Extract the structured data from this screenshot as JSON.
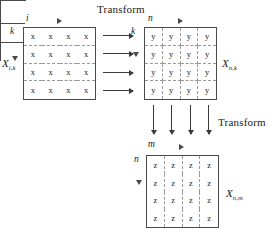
{
  "figure": {
    "type": "three-stage-transform-diagram",
    "transform_labels": [
      {
        "id": "transform-top",
        "text": "Transform"
      },
      {
        "id": "transform-right",
        "text": "Transform"
      }
    ],
    "matrices": [
      {
        "id": "matrix-x-ik",
        "name": "X",
        "subscript": "i,k",
        "entry": "x",
        "rows": 4,
        "cols": 4,
        "dashed": "rows",
        "horizontal_index": "i",
        "vertical_index": "k",
        "cells": [
          [
            "x",
            "x",
            "x",
            "x"
          ],
          [
            "x",
            "x",
            "x",
            "x"
          ],
          [
            "x",
            "x",
            "x",
            "x"
          ],
          [
            "x",
            "x",
            "x",
            "x"
          ]
        ]
      },
      {
        "id": "matrix-x-nk",
        "name": "X",
        "subscript": "n,k",
        "entry": "y",
        "rows": 4,
        "cols": 4,
        "dashed": "grid",
        "horizontal_index": "n",
        "vertical_index": "k",
        "cells": [
          [
            "y",
            "y",
            "y",
            "y"
          ],
          [
            "y",
            "y",
            "y",
            "y"
          ],
          [
            "y",
            "y",
            "y",
            "y"
          ],
          [
            "y",
            "y",
            "y",
            "y"
          ]
        ]
      },
      {
        "id": "matrix-x-nm",
        "name": "X",
        "subscript": "n,m",
        "entry": "z",
        "rows": 4,
        "cols": 4,
        "dashed": "cols",
        "horizontal_index": "m",
        "vertical_index": "n",
        "cells": [
          [
            "z",
            "z",
            "z",
            "z"
          ],
          [
            "z",
            "z",
            "z",
            "z"
          ],
          [
            "z",
            "z",
            "z",
            "z"
          ],
          [
            "z",
            "z",
            "z",
            "z"
          ]
        ]
      }
    ],
    "flow_arrows": {
      "horizontal_count": 4,
      "vertical_count": 4
    },
    "colors": {
      "ink": "#1a1a1a",
      "border": "#4a4a4a",
      "dashed": "#9a9a9a",
      "background": "#ffffff"
    }
  }
}
